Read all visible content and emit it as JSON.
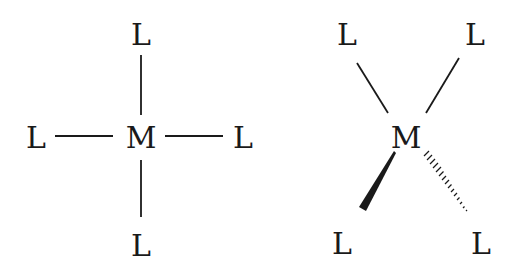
{
  "diagrams": [
    {
      "name": "square-planar",
      "center": {
        "label": "M",
        "x": 141,
        "y": 137
      },
      "ligands": [
        {
          "label": "L",
          "x": 141,
          "y": 34,
          "position": "top"
        },
        {
          "label": "L",
          "x": 36,
          "y": 137,
          "position": "left"
        },
        {
          "label": "L",
          "x": 243,
          "y": 137,
          "position": "right"
        },
        {
          "label": "L",
          "x": 141,
          "y": 245,
          "position": "bottom"
        }
      ]
    },
    {
      "name": "tetrahedral",
      "center": {
        "label": "M",
        "x": 406,
        "y": 137
      },
      "ligands": [
        {
          "label": "L",
          "x": 347,
          "y": 34,
          "position": "top-left",
          "bond": "plain"
        },
        {
          "label": "L",
          "x": 475,
          "y": 34,
          "position": "top-right",
          "bond": "plain"
        },
        {
          "label": "L",
          "x": 342,
          "y": 243,
          "position": "bottom-left",
          "bond": "wedge"
        },
        {
          "label": "L",
          "x": 481,
          "y": 243,
          "position": "bottom-right",
          "bond": "hashed"
        }
      ]
    }
  ],
  "colors": {
    "ink": "#1a1a1a",
    "background": "#ffffff"
  }
}
